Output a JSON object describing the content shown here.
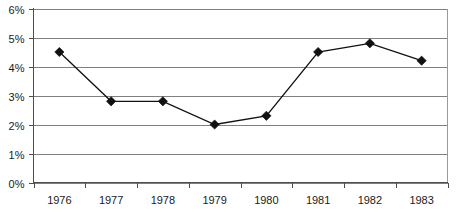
{
  "chart_data": {
    "type": "line",
    "title": "",
    "subtitle": "",
    "xlabel": "",
    "ylabel": "",
    "categories": [
      "1976",
      "1977",
      "1978",
      "1979",
      "1980",
      "1981",
      "1982",
      "1983"
    ],
    "values": [
      4.5,
      2.8,
      2.8,
      2.0,
      2.3,
      4.5,
      4.8,
      4.2
    ],
    "series": [
      {
        "name": "",
        "values": [
          4.5,
          2.8,
          2.8,
          2.0,
          2.3,
          4.5,
          4.8,
          4.2
        ]
      }
    ],
    "ylim": [
      0,
      6
    ],
    "ytick_values": [
      0,
      1,
      2,
      3,
      4,
      5,
      6
    ],
    "ytick_labels": [
      "0%",
      "1%",
      "2%",
      "3%",
      "4%",
      "5%",
      "6%"
    ],
    "xtick_labels": [
      "1976",
      "1977",
      "1978",
      "1979",
      "1980",
      "1981",
      "1982",
      "1983"
    ],
    "grid": "horizontal",
    "legend": "none",
    "marker": "diamond",
    "line_color": "#111111",
    "marker_color": "#111111",
    "gridline_color": "#808080",
    "background_color": "#ffffff",
    "value_unit": "%"
  }
}
